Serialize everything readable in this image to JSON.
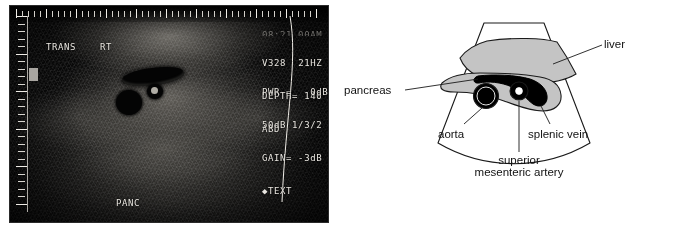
{
  "figure": {
    "kind": "abdominal-ultrasound-with-labeled-diagram"
  },
  "ultrasound": {
    "overlay": {
      "top_clipped_line": "08:21 00AM",
      "probe_id": "V328",
      "frame_rate": "21HZ",
      "depth": "DEPTH= 140",
      "preset": "ABD",
      "power": "PWR =   0dB",
      "dynamic_range": "50dB 1/3/2",
      "gain": "GAIN= -3dB",
      "text_mode": "◆TEXT",
      "plane": "TRANS",
      "side": "RT",
      "organ_annotation": "PANC"
    },
    "ruler": {
      "vertical_ticks": 26,
      "vertical_major_every": 5,
      "horizontal_ticks": 46,
      "horizontal_major_every": 5
    },
    "colors": {
      "screen_background": "#0a0a0a",
      "overlay_text": "#e9e6e0",
      "focus_marker": "#a8a5a0"
    }
  },
  "diagram": {
    "labels": {
      "liver": "liver",
      "pancreas": "pancreas",
      "aorta": "aorta",
      "splenic_vein": "splenic vein",
      "sma_line1": "superior",
      "sma_line2": "mesenteric artery"
    },
    "colors": {
      "outline": "#1a1a1a",
      "organ_fill": "#c4c4c4",
      "vessel_fill": "#000000",
      "background": "#ffffff"
    }
  }
}
